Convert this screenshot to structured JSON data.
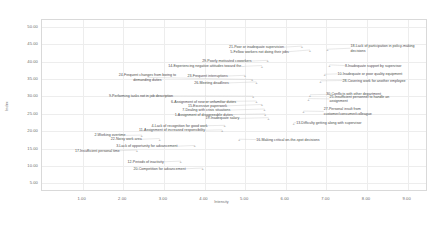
{
  "chart_data": {
    "type": "scatter",
    "title": "",
    "xlabel": "Intensity",
    "ylabel": "Index",
    "xlim": [
      0.0,
      9.5
    ],
    "ylim": [
      2.5,
      52.0
    ],
    "grid": true,
    "legend": "none",
    "xticks": [
      "1.00",
      "2.00",
      "3.00",
      "4.00",
      "5.00",
      "6.00",
      "7.00",
      "8.00",
      "9.00"
    ],
    "xtick_values": [
      1,
      2,
      3,
      4,
      5,
      6,
      7,
      8,
      9
    ],
    "yticks": [
      "5.00",
      "10.00",
      "15.00",
      "20.00",
      "25.00",
      "30.00",
      "35.00",
      "40.00",
      "45.00",
      "50.00"
    ],
    "ytick_values": [
      5,
      10,
      15,
      20,
      25,
      30,
      35,
      40,
      45,
      50
    ],
    "points": [
      {
        "id": 21,
        "label": "21-Poor or inadequate supervision",
        "x": 6.42,
        "y": 44.2,
        "lx": 5.98,
        "ly": 43.9,
        "align": "r"
      },
      {
        "id": 5,
        "label": "5-Fellow workers not doing their jobs",
        "x": 6.62,
        "y": 43.1,
        "lx": 6.1,
        "ly": 42.6,
        "align": "r"
      },
      {
        "id": 18,
        "label": "18-Lack of participation in policy-making\ndecisions",
        "x": 7.05,
        "y": 43.3,
        "lx": 7.62,
        "ly": 43.6,
        "align": "l"
      },
      {
        "id": 29,
        "label": "29-Poorly motivated coworkers",
        "x": 5.58,
        "y": 40.1,
        "lx": 5.18,
        "ly": 39.9,
        "align": "r"
      },
      {
        "id": 14,
        "label": "14-Experiencing negative attitudes toward the...",
        "x": 5.44,
        "y": 38.6,
        "lx": 5.0,
        "ly": 38.4,
        "align": "r"
      },
      {
        "id": 8,
        "label": "8-Inadequate support by supervisor",
        "x": 7.1,
        "y": 38.8,
        "lx": 7.48,
        "ly": 38.6,
        "align": "l"
      },
      {
        "id": 10,
        "label": "10-Inadequate or poor quality equipment",
        "x": 6.98,
        "y": 36.1,
        "lx": 7.3,
        "ly": 36.2,
        "align": "l"
      },
      {
        "id": 23,
        "label": "23-Frequent interruptions",
        "x": 5.02,
        "y": 35.8,
        "lx": 4.6,
        "ly": 35.6,
        "align": "r"
      },
      {
        "id": 28,
        "label": "28-Covering work for another employee",
        "x": 6.88,
        "y": 34.2,
        "lx": 7.42,
        "ly": 34.3,
        "align": "l"
      },
      {
        "id": 24,
        "label": "24-Frequent changes from boring to\ndemanding duties",
        "x": 5.2,
        "y": 34.6,
        "lx": 2.62,
        "ly": 35.2,
        "align": "c"
      },
      {
        "id": 26,
        "label": "26-Meeting deadlines",
        "x": 5.3,
        "y": 33.9,
        "lx": 4.62,
        "ly": 33.6,
        "align": "r"
      },
      {
        "id": 30,
        "label": "30-Conflicts with other department",
        "x": 6.62,
        "y": 30.2,
        "lx": 7.02,
        "ly": 30.3,
        "align": "l"
      },
      {
        "id": 25,
        "label": "25-Insufficient personnel to handle an\nassignment",
        "x": 6.58,
        "y": 29.1,
        "lx": 7.1,
        "ly": 29.0,
        "align": "l"
      },
      {
        "id": 9,
        "label": "9-Performing tasks not in job description",
        "x": 5.22,
        "y": 29.8,
        "lx": 2.46,
        "ly": 29.9,
        "align": "c"
      },
      {
        "id": 6,
        "label": "6-Assignment of new or unfamiliar duties",
        "x": 5.3,
        "y": 28.4,
        "lx": 4.0,
        "ly": 28.2,
        "align": "c"
      },
      {
        "id": 15,
        "label": "15-Excessive paperwork",
        "x": 5.44,
        "y": 27.4,
        "lx": 4.58,
        "ly": 27.0,
        "align": "r"
      },
      {
        "id": 7,
        "label": "7-Dealing with crisis situations",
        "x": 5.5,
        "y": 26.1,
        "lx": 4.66,
        "ly": 25.8,
        "align": "r"
      },
      {
        "id": 27,
        "label": "27-Personal insult from\ncustomer/consumer/colleague",
        "x": 6.46,
        "y": 25.5,
        "lx": 6.96,
        "ly": 25.4,
        "align": "l"
      },
      {
        "id": 1,
        "label": "1-Assignment of disagreeable duties",
        "x": 5.52,
        "y": 24.7,
        "lx": 4.72,
        "ly": 24.5,
        "align": "r"
      },
      {
        "id": 19,
        "label": "19-Inadequate salary",
        "x": 5.6,
        "y": 23.6,
        "lx": 4.88,
        "ly": 23.4,
        "align": "r"
      },
      {
        "id": 13,
        "label": "13-Difficulty getting along with supervisor",
        "x": 6.22,
        "y": 22.1,
        "lx": 6.28,
        "ly": 22.2,
        "align": "l"
      },
      {
        "id": 4,
        "label": "4-Lack of recognition for good work",
        "x": 4.52,
        "y": 21.4,
        "lx": 4.1,
        "ly": 21.3,
        "align": "r"
      },
      {
        "id": 11,
        "label": "11-Assignment of increased responsibility",
        "x": 4.46,
        "y": 20.1,
        "lx": 4.04,
        "ly": 20.0,
        "align": "r"
      },
      {
        "id": 2,
        "label": "2-Working overtime",
        "x": 2.48,
        "y": 18.6,
        "lx": 2.08,
        "ly": 18.5,
        "align": "r"
      },
      {
        "id": 22,
        "label": "22-Noisy work area",
        "x": 2.92,
        "y": 17.6,
        "lx": 2.48,
        "ly": 17.4,
        "align": "r"
      },
      {
        "id": 16,
        "label": "16-Making critical on-the-spot decisions",
        "x": 4.88,
        "y": 17.4,
        "lx": 5.3,
        "ly": 17.3,
        "align": "l"
      },
      {
        "id": 3,
        "label": "3-Lack of opportunity for advancement",
        "x": 3.78,
        "y": 15.6,
        "lx": 3.36,
        "ly": 15.4,
        "align": "r"
      },
      {
        "id": 17,
        "label": "17-Insufficient personal time",
        "x": 2.36,
        "y": 14.3,
        "lx": 1.94,
        "ly": 14.1,
        "align": "r"
      },
      {
        "id": 12,
        "label": "12-Periods of inactivity",
        "x": 3.44,
        "y": 11.1,
        "lx": 3.02,
        "ly": 10.9,
        "align": "r"
      },
      {
        "id": 20,
        "label": "20-Competition for advancement",
        "x": 3.98,
        "y": 9.1,
        "lx": 3.56,
        "ly": 8.9,
        "align": "r"
      }
    ]
  }
}
